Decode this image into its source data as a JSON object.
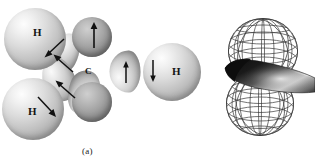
{
  "figure": {
    "background_color": "#ffffff",
    "captions": [
      {
        "id": "a",
        "text": "(a)"
      },
      {
        "id": "b",
        "text": "(b)"
      }
    ]
  },
  "panel_a": {
    "name": "molecular-model-sp3-hybrid-orbitals",
    "description": "Shaded sphere model of a carbon atom bonded to hydrogen atoms with sp3 hybrid orbital lobes and electron spin arrows",
    "central_atom": {
      "symbol": "C",
      "label": "C"
    },
    "hydrogen_atoms": [
      {
        "id": "h-upper-left",
        "label": "H"
      },
      {
        "id": "h-lower-left",
        "label": "H"
      },
      {
        "id": "h-right",
        "label": "H"
      }
    ],
    "spin_arrows": [
      {
        "id": "arrow-top-vertical",
        "direction": "up"
      },
      {
        "id": "arrow-upper-left-diag",
        "direction": "down-left"
      },
      {
        "id": "arrow-mid-left-diag",
        "direction": "up-left"
      },
      {
        "id": "arrow-lower-left-diag",
        "direction": "up-left"
      },
      {
        "id": "arrow-lower-left-h-diag",
        "direction": "down-right"
      },
      {
        "id": "arrow-right-inner",
        "direction": "up"
      },
      {
        "id": "arrow-right-outer",
        "direction": "down"
      }
    ],
    "atom_colors": {
      "hydrogen": "#d9d9d9",
      "carbon": "#9a9a9a",
      "lobe": "#c6c6c6"
    }
  },
  "panel_b": {
    "name": "p-orbital-wireframe-with-hybrid-lobe",
    "description": "Wireframe mesh of a two-lobed p orbital with a solid shaded hybrid orbital passing through the nodal region",
    "mesh_color": "#3a3a3a",
    "solid_lobe_color": "#1f1f1f",
    "lobes": [
      {
        "id": "upper-lobe",
        "type": "wireframe"
      },
      {
        "id": "lower-lobe",
        "type": "wireframe"
      },
      {
        "id": "solid-hybrid-lobe",
        "type": "solid-shaded"
      }
    ]
  }
}
